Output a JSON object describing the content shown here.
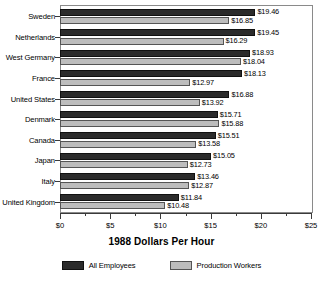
{
  "chart_data": {
    "type": "bar",
    "orientation": "horizontal",
    "title": "",
    "xlabel": "1988 Dollars Per Hour",
    "ylabel": "",
    "xlim": [
      0,
      25
    ],
    "xticks": [
      0,
      5,
      10,
      15,
      20,
      25
    ],
    "xtick_labels": [
      "$0",
      "$5",
      "$10",
      "$15",
      "$20",
      "$25"
    ],
    "minor_tick_interval": 2.5,
    "grid": false,
    "legend_position": "bottom",
    "categories": [
      "Sweden",
      "Netherlands",
      "West Germany",
      "France",
      "United States",
      "Denmark",
      "Canada",
      "Japan",
      "Italy",
      "United Kingdom"
    ],
    "series": [
      {
        "name": "All Employees",
        "color": "#2b2b2b",
        "values": [
          19.46,
          19.45,
          18.93,
          18.13,
          16.88,
          15.71,
          15.51,
          15.05,
          13.46,
          11.84
        ],
        "labels": [
          "$19.46",
          "$19.45",
          "$18.93",
          "$18.13",
          "$16.88",
          "$15.71",
          "$15.51",
          "$15.05",
          "$13.46",
          "$11.84"
        ]
      },
      {
        "name": "Production Workers",
        "color": "#bdbdbd",
        "values": [
          16.85,
          16.29,
          18.04,
          12.97,
          13.92,
          15.88,
          13.58,
          12.73,
          12.87,
          10.48
        ],
        "labels": [
          "$16.85",
          "$16.29",
          "$18.04",
          "$12.97",
          "$13.92",
          "$15.88",
          "$13.58",
          "$12.73",
          "$12.87",
          "$10.48"
        ]
      }
    ]
  }
}
